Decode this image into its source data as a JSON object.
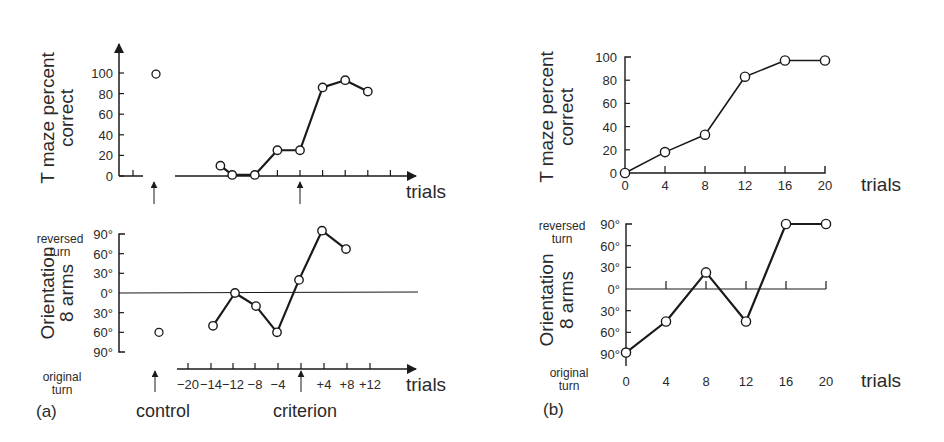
{
  "figure": {
    "panel_labels": [
      "(a)",
      "(b)"
    ],
    "annotations": {
      "control": "control",
      "criterion": "criterion"
    }
  },
  "chart_data": [
    {
      "id": "a-top",
      "panel": "(a)",
      "type": "line",
      "title": "",
      "ylabel": [
        "T maze percent",
        "correct"
      ],
      "xlabel": "trials",
      "ylim": [
        0,
        100
      ],
      "yticks": [
        "0",
        "20",
        "40",
        "60",
        "80",
        "100"
      ],
      "ytick_values": [
        0,
        20,
        40,
        60,
        80,
        100
      ],
      "x_tick_labels": [],
      "control_point": {
        "label": "control",
        "y": 99
      },
      "series": [
        {
          "name": "T maze percent correct",
          "x": [
            -14,
            -12,
            -8,
            -4,
            0,
            4,
            8,
            12
          ],
          "y": [
            10,
            1,
            1,
            25,
            25,
            86,
            93,
            82
          ]
        }
      ],
      "criterion_marker_x": 0,
      "grid": false
    },
    {
      "id": "a-bottom",
      "panel": "(a)",
      "type": "line",
      "title": "",
      "ylabel": [
        "Orientation",
        "8 arms"
      ],
      "ylabel_top": [
        "reversed",
        "turn"
      ],
      "ylabel_bottom": [
        "original",
        "turn"
      ],
      "xlabel": "trials",
      "ylim": [
        -90,
        90
      ],
      "yticks": [
        "90°",
        "60°",
        "30°",
        "0°",
        "30°",
        "60°",
        "90°"
      ],
      "ytick_values": [
        90,
        60,
        30,
        0,
        -30,
        -60,
        -90
      ],
      "x_tick_labels": [
        "−20",
        "−14",
        "−12",
        "−8",
        "−4",
        "",
        "+4",
        "+8",
        "+12"
      ],
      "control_point": {
        "label": "control",
        "y": -60
      },
      "series": [
        {
          "name": "Orientation",
          "x": [
            -14,
            -12,
            -8,
            -4,
            0,
            4,
            8
          ],
          "y": [
            -50,
            0,
            -20,
            -60,
            20,
            95,
            67
          ]
        }
      ],
      "criterion_marker_x": 0,
      "grid": false
    },
    {
      "id": "b-top",
      "panel": "(b)",
      "type": "line",
      "title": "",
      "ylabel": [
        "T maze percent",
        "correct"
      ],
      "xlabel": "trials",
      "ylim": [
        0,
        100
      ],
      "yticks": [
        "0",
        "20",
        "40",
        "60",
        "80",
        "100"
      ],
      "ytick_values": [
        0,
        20,
        40,
        60,
        80,
        100
      ],
      "categories": [
        "0",
        "4",
        "8",
        "12",
        "16",
        "20"
      ],
      "series": [
        {
          "name": "T maze percent correct",
          "x": [
            0,
            4,
            8,
            12,
            16,
            20
          ],
          "y": [
            0,
            18,
            33,
            83,
            97,
            97
          ]
        }
      ],
      "grid": false
    },
    {
      "id": "b-bottom",
      "panel": "(b)",
      "type": "line",
      "title": "",
      "ylabel": [
        "Orientation",
        "8 arms"
      ],
      "ylabel_top": [
        "reversed",
        "turn"
      ],
      "ylabel_bottom": [
        "original",
        "turn"
      ],
      "xlabel": "trials",
      "ylim": [
        -90,
        90
      ],
      "yticks": [
        "90°",
        "60°",
        "30°",
        "0°",
        "30°",
        "60°",
        "90°"
      ],
      "ytick_values": [
        90,
        60,
        30,
        0,
        -30,
        -60,
        -90
      ],
      "categories": [
        "0",
        "4",
        "8",
        "12",
        "16",
        "20"
      ],
      "series": [
        {
          "name": "Orientation",
          "x": [
            0,
            4,
            8,
            12,
            16,
            20
          ],
          "y": [
            -88,
            -45,
            23,
            -45,
            90,
            90
          ]
        }
      ],
      "grid": false
    }
  ]
}
